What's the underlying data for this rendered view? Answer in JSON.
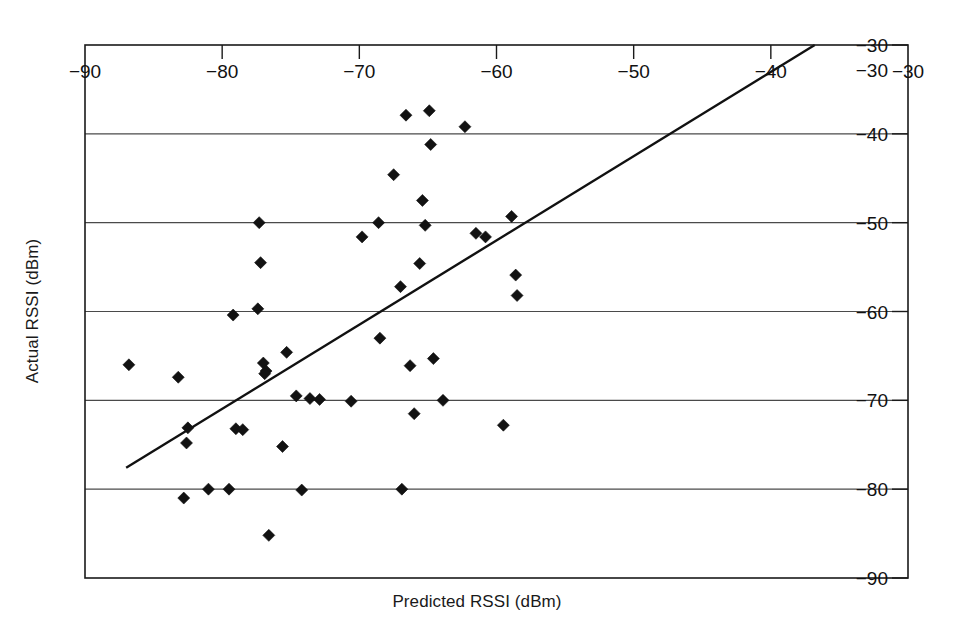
{
  "chart_data": {
    "type": "scatter",
    "title": "",
    "xlabel": "Predicted RSSI (dBm)",
    "ylabel": "Actual RSSI (dBm)",
    "xlim": [
      -90,
      -30
    ],
    "ylim": [
      -90,
      -30
    ],
    "xticks": [
      -90,
      -80,
      -70,
      -60,
      -50,
      -40,
      -30
    ],
    "yticks": [
      -30,
      -40,
      -50,
      -60,
      -70,
      -80,
      -90
    ],
    "xtick_labels": [
      "−90",
      "−80",
      "−70",
      "−60",
      "−50",
      "−40",
      "−30"
    ],
    "ytick_labels": [
      "−30",
      "−40",
      "−50",
      "−60",
      "−70",
      "−80",
      "−90"
    ],
    "grid": "horizontal",
    "grid_color": "#4a4a4a",
    "axis_label_position": "inside",
    "xtick_label_position": "inside-top",
    "ytick_label_position": "inside-right",
    "legend": "none",
    "marker_style": "filled-diamond",
    "marker_color": "#121212",
    "line_color": "#111111",
    "series": [
      {
        "name": "Measurements",
        "points": [
          [
            -86.8,
            -66.0
          ],
          [
            -83.2,
            -67.4
          ],
          [
            -82.8,
            -81.0
          ],
          [
            -82.5,
            -73.1
          ],
          [
            -82.6,
            -74.8
          ],
          [
            -81.0,
            -80.0
          ],
          [
            -79.5,
            -80.0
          ],
          [
            -79.2,
            -60.4
          ],
          [
            -79.0,
            -73.2
          ],
          [
            -78.5,
            -73.3
          ],
          [
            -77.3,
            -50.0
          ],
          [
            -77.2,
            -54.5
          ],
          [
            -77.4,
            -59.7
          ],
          [
            -77.0,
            -65.8
          ],
          [
            -76.8,
            -66.7
          ],
          [
            -76.9,
            -67.0
          ],
          [
            -76.6,
            -85.2
          ],
          [
            -75.6,
            -75.2
          ],
          [
            -75.3,
            -64.6
          ],
          [
            -74.6,
            -69.5
          ],
          [
            -74.2,
            -80.1
          ],
          [
            -73.6,
            -69.8
          ],
          [
            -72.9,
            -69.9
          ],
          [
            -70.6,
            -70.1
          ],
          [
            -69.8,
            -51.6
          ],
          [
            -68.6,
            -50.0
          ],
          [
            -68.5,
            -63.0
          ],
          [
            -67.5,
            -44.6
          ],
          [
            -67.0,
            -57.2
          ],
          [
            -66.9,
            -80.0
          ],
          [
            -66.6,
            -37.9
          ],
          [
            -66.3,
            -66.1
          ],
          [
            -66.0,
            -71.5
          ],
          [
            -65.6,
            -54.6
          ],
          [
            -65.4,
            -47.5
          ],
          [
            -65.2,
            -50.3
          ],
          [
            -64.9,
            -37.4
          ],
          [
            -64.8,
            -41.2
          ],
          [
            -64.6,
            -65.3
          ],
          [
            -63.9,
            -70.0
          ],
          [
            -62.3,
            -39.2
          ],
          [
            -61.5,
            -51.2
          ],
          [
            -60.8,
            -51.6
          ],
          [
            -59.5,
            -72.8
          ],
          [
            -58.9,
            -49.3
          ],
          [
            -58.6,
            -55.9
          ],
          [
            -58.5,
            -58.2
          ]
        ]
      }
    ],
    "fit_line": {
      "name": "Linear fit",
      "x_start": -87.0,
      "y_start": -77.6,
      "x_end": -36.8,
      "y_end": -30.0
    }
  },
  "axes": {
    "x_title": "Predicted RSSI (dBm)",
    "y_title": "Actual RSSI (dBm)"
  }
}
